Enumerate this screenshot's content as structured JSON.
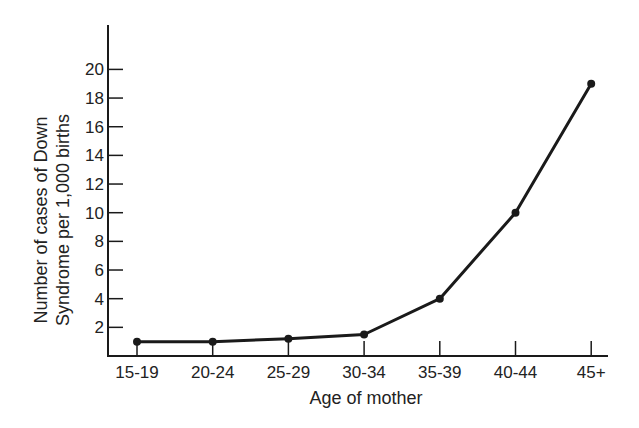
{
  "chart_data": {
    "type": "line",
    "title": "",
    "xlabel": "Age of mother",
    "ylabel_lines": [
      "Number of cases of Down",
      "Syndrome per 1,000 births"
    ],
    "ylabel": "Number of cases of Down Syndrome per 1,000 births",
    "categories": [
      "15-19",
      "20-24",
      "25-29",
      "30-34",
      "35-39",
      "40-44",
      "45+"
    ],
    "values": [
      1,
      1,
      1.2,
      1.5,
      4,
      10,
      19
    ],
    "yticks": [
      2,
      4,
      6,
      8,
      10,
      12,
      14,
      16,
      18,
      20
    ],
    "ylim": [
      0,
      21.5
    ],
    "grid": false,
    "legend": null,
    "markers": "filled-circle",
    "line_color": "#1a1a1a"
  }
}
